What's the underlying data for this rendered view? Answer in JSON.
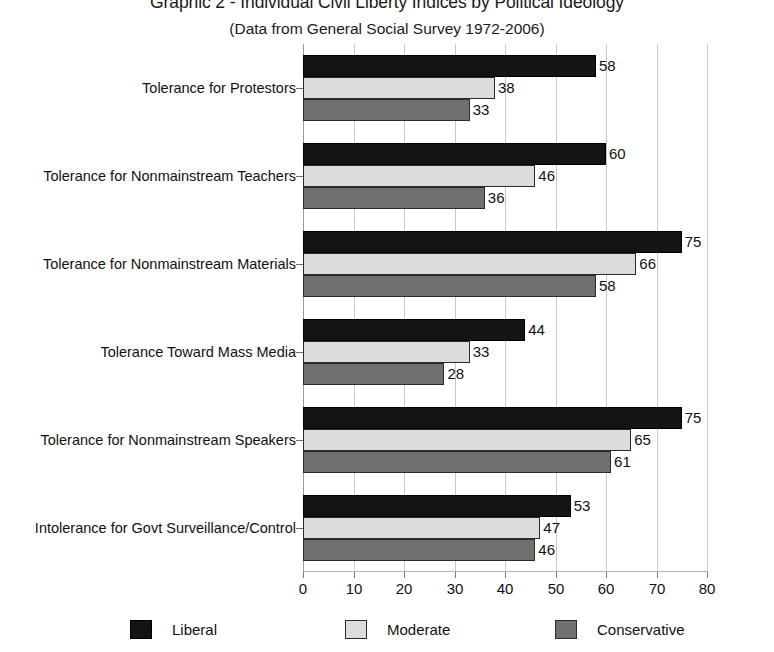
{
  "chart_data": {
    "type": "bar",
    "orientation": "horizontal",
    "title": "Graphic 2 - Individual Civil Liberty Indices by Political Ideology",
    "subtitle": "(Data from General Social Survey 1972-2006)",
    "xlabel": "",
    "ylabel": "",
    "xlim": [
      0,
      80
    ],
    "xticks": [
      0,
      10,
      20,
      30,
      40,
      50,
      60,
      70,
      80
    ],
    "grid": true,
    "legend_position": "bottom",
    "categories": [
      "Tolerance for Protestors",
      "Tolerance for Nonmainstream Teachers",
      "Tolerance for Nonmainstream Materials",
      "Tolerance Toward Mass Media",
      "Tolerance for Nonmainstream Speakers",
      "Intolerance for Govt Surveillance/Control"
    ],
    "series": [
      {
        "name": "Liberal",
        "color": "#141414",
        "values": [
          58,
          60,
          75,
          44,
          75,
          53
        ]
      },
      {
        "name": "Moderate",
        "color": "#dcdcdc",
        "values": [
          38,
          46,
          66,
          33,
          65,
          47
        ]
      },
      {
        "name": "Conservative",
        "color": "#707070",
        "values": [
          33,
          36,
          58,
          28,
          61,
          46
        ]
      }
    ]
  }
}
